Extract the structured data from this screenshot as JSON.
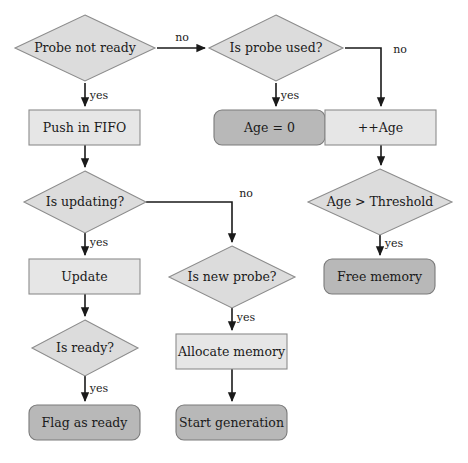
{
  "diagram": {
    "width": 468,
    "height": 463,
    "background": "#ffffff",
    "colors": {
      "process_fill": "#e6e6e6",
      "terminal_fill": "#b8b8b8",
      "decision_fill": "#dcdcdc",
      "shape_stroke": "#8c8c8c",
      "edge_stroke": "#1a1a1a",
      "text": "#1a1a1a"
    },
    "nodes": [
      {
        "id": "probe_not_ready",
        "label": "Probe not ready",
        "shape": "diamond",
        "cx": 85,
        "cy": 48,
        "rx": 70,
        "ry": 33
      },
      {
        "id": "is_probe_used",
        "label": "Is probe used?",
        "shape": "diamond",
        "cx": 276,
        "cy": 48,
        "rx": 67,
        "ry": 33
      },
      {
        "id": "push_in_fifo",
        "label": "Push in FIFO",
        "shape": "rect",
        "x": 29,
        "y": 110,
        "w": 111,
        "h": 35
      },
      {
        "id": "age_zero",
        "label": "Age = 0",
        "shape": "rounded",
        "x": 214,
        "y": 110,
        "w": 111,
        "h": 35
      },
      {
        "id": "age_increment",
        "label": "++Age",
        "shape": "rect",
        "x": 325,
        "y": 110,
        "w": 111,
        "h": 35
      },
      {
        "id": "is_updating",
        "label": "Is updating?",
        "shape": "diamond",
        "cx": 85,
        "cy": 202,
        "rx": 61,
        "ry": 31
      },
      {
        "id": "age_gt_threshold",
        "label": "Age > Threshold",
        "shape": "diamond",
        "cx": 380,
        "cy": 202,
        "rx": 72,
        "ry": 33
      },
      {
        "id": "update",
        "label": "Update",
        "shape": "rect",
        "x": 29,
        "y": 259,
        "w": 111,
        "h": 35
      },
      {
        "id": "is_new_probe",
        "label": "Is new probe?",
        "shape": "diamond",
        "cx": 232,
        "cy": 277,
        "rx": 63,
        "ry": 31
      },
      {
        "id": "free_memory",
        "label": "Free memory",
        "shape": "rounded",
        "x": 324,
        "y": 259,
        "w": 111,
        "h": 35
      },
      {
        "id": "is_ready",
        "label": "Is ready?",
        "shape": "diamond",
        "cx": 85,
        "cy": 348,
        "rx": 53,
        "ry": 28
      },
      {
        "id": "allocate_memory",
        "label": "Allocate memory",
        "shape": "rect",
        "x": 176,
        "y": 334,
        "w": 111,
        "h": 35
      },
      {
        "id": "flag_as_ready",
        "label": "Flag as ready",
        "shape": "rounded",
        "x": 29,
        "y": 405,
        "w": 111,
        "h": 35
      },
      {
        "id": "start_generation",
        "label": "Start generation",
        "shape": "rounded",
        "x": 176,
        "y": 405,
        "w": 111,
        "h": 35
      }
    ],
    "edges": [
      {
        "id": "probe-not-ready-no",
        "from": "probe_not_ready",
        "to": "is_probe_used",
        "label": "no",
        "label_x": 182,
        "label_y": 38,
        "path": "M 157 48 L 205 48"
      },
      {
        "id": "probe-not-ready-yes",
        "from": "probe_not_ready",
        "to": "push_in_fifo",
        "label": "yes",
        "label_x": 99,
        "label_y": 96,
        "path": "M 85 83 L 85 106"
      },
      {
        "id": "is-probe-used-yes",
        "from": "is_probe_used",
        "to": "age_zero",
        "label": "yes",
        "label_x": 290,
        "label_y": 96,
        "path": "M 276 83 L 276 106"
      },
      {
        "id": "is-probe-used-no",
        "from": "is_probe_used",
        "to": "age_increment",
        "label": "no",
        "label_x": 400,
        "label_y": 50,
        "path": "M 345 48 L 381 48 L 381 106"
      },
      {
        "id": "push-in-fifo-to-is-updating",
        "from": "push_in_fifo",
        "to": "is_updating",
        "label": "",
        "label_x": 0,
        "label_y": 0,
        "path": "M 85 145 L 85 167"
      },
      {
        "id": "age-increment-to-threshold",
        "from": "age_increment",
        "to": "age_gt_threshold",
        "label": "",
        "label_x": 0,
        "label_y": 0,
        "path": "M 381 145 L 381 165"
      },
      {
        "id": "is-updating-yes",
        "from": "is_updating",
        "to": "update",
        "label": "yes",
        "label_x": 99,
        "label_y": 243,
        "path": "M 85 233 L 85 255"
      },
      {
        "id": "is-updating-no",
        "from": "is_updating",
        "to": "is_new_probe",
        "label": "no",
        "label_x": 246,
        "label_y": 194,
        "path": "M 146 202 L 232 202 L 232 242"
      },
      {
        "id": "threshold-yes",
        "from": "age_gt_threshold",
        "to": "free_memory",
        "label": "yes",
        "label_x": 394,
        "label_y": 244,
        "path": "M 380 235 L 380 255"
      },
      {
        "id": "update-to-is-ready",
        "from": "update",
        "to": "is_ready",
        "label": "",
        "label_x": 0,
        "label_y": 0,
        "path": "M 85 294 L 85 316"
      },
      {
        "id": "is-new-probe-yes",
        "from": "is_new_probe",
        "to": "allocate_memory",
        "label": "yes",
        "label_x": 246,
        "label_y": 318,
        "path": "M 232 308 L 232 330"
      },
      {
        "id": "is-ready-yes",
        "from": "is_ready",
        "to": "flag_as_ready",
        "label": "yes",
        "label_x": 99,
        "label_y": 389,
        "path": "M 85 376 L 85 401"
      },
      {
        "id": "allocate-to-start-generation",
        "from": "allocate_memory",
        "to": "start_generation",
        "label": "",
        "label_x": 0,
        "label_y": 0,
        "path": "M 232 369 L 232 401"
      }
    ]
  }
}
